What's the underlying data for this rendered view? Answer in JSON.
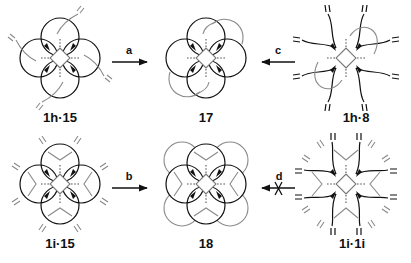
{
  "scheme": {
    "compounds": [
      {
        "id": "c1",
        "label": "1h·15",
        "type": "four-loop-threaded"
      },
      {
        "id": "c2",
        "label": "17",
        "type": "four-loop-two-bridges"
      },
      {
        "id": "c3",
        "label": "1h·8",
        "type": "open-arms-two-gray-loops"
      },
      {
        "id": "c4",
        "label": "1i·15",
        "type": "four-loop-branched"
      },
      {
        "id": "c5",
        "label": "18",
        "type": "eight-loop"
      },
      {
        "id": "c6",
        "label": "1i·1i",
        "type": "open-arms-branched"
      }
    ],
    "arrows": [
      {
        "id": "a",
        "label": "a",
        "from": "1h·15",
        "to": "17",
        "blocked": false
      },
      {
        "id": "c",
        "label": "c",
        "from": "1h·8",
        "to": "17",
        "blocked": false
      },
      {
        "id": "b",
        "label": "b",
        "from": "1i·15",
        "to": "18",
        "blocked": false
      },
      {
        "id": "d",
        "label": "d",
        "from": "1i·1i",
        "to": "18",
        "blocked": true
      }
    ]
  }
}
